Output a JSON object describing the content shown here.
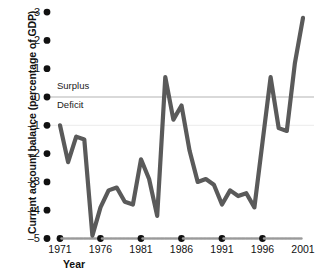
{
  "chart_data": {
    "type": "line",
    "title": "",
    "xlabel": "Year",
    "ylabel": "Current account balance (percentage of GDP)",
    "xlim": [
      1970.4,
      2001.6
    ],
    "ylim": [
      -5,
      3
    ],
    "yticks": [
      3,
      2,
      1,
      0,
      -1,
      -2,
      -3,
      -4,
      -5
    ],
    "ytick_labels": [
      "3",
      "2",
      "1",
      "0",
      "–1",
      "–2",
      "–3",
      "–4",
      "–5"
    ],
    "xticks": [
      1971,
      1976,
      1981,
      1986,
      1991,
      1996,
      2001
    ],
    "xtick_labels": [
      "1971",
      "1976",
      "1981",
      "1986",
      "1991",
      "1996",
      "2001"
    ],
    "grid": false,
    "reference_lines": [
      {
        "y": 0,
        "color": "#b3b3b3",
        "label_above": "Surplus",
        "label_below": "Deficit"
      },
      {
        "y": -1,
        "color": "#ececec",
        "label_above": "",
        "label_below": ""
      }
    ],
    "annotations": [
      {
        "text": "Surplus",
        "x": 1971.6,
        "y": 0.55
      },
      {
        "text": "Deficit",
        "x": 1971.6,
        "y": -0.5
      }
    ],
    "legend": null,
    "legend_position": "none",
    "line_color": "#5a5a5a",
    "line_width": 4.2,
    "series": [
      {
        "name": "Current account balance",
        "x": [
          1971,
          1972,
          1973,
          1974,
          1975,
          1976,
          1977,
          1978,
          1979,
          1980,
          1981,
          1982,
          1983,
          1984,
          1985,
          1986,
          1987,
          1988,
          1989,
          1990,
          1991,
          1992,
          1993,
          1994,
          1995,
          1996,
          1997,
          1998,
          1999,
          2000,
          2001
        ],
        "values": [
          -1.0,
          -2.3,
          -1.4,
          -1.5,
          -4.9,
          -3.9,
          -3.3,
          -3.2,
          -3.7,
          -3.8,
          -2.2,
          -2.9,
          -4.2,
          0.7,
          -0.8,
          -0.3,
          -1.9,
          -3.0,
          -2.9,
          -3.1,
          -3.8,
          -3.3,
          -3.5,
          -3.4,
          -3.9,
          -1.6,
          0.7,
          -1.1,
          -1.2,
          1.2,
          2.8
        ]
      }
    ]
  },
  "axis": {
    "x_title": "Year",
    "y_title": "Current account balance (percentage of GDP)"
  },
  "annotations": {
    "surplus": "Surplus",
    "deficit": "Deficit"
  }
}
